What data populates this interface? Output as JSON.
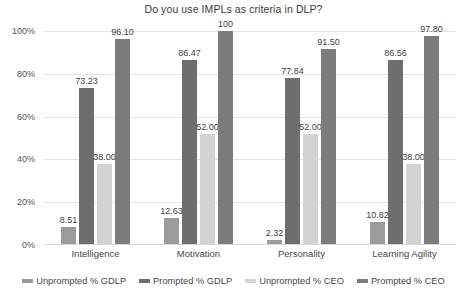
{
  "chart_data": {
    "type": "bar",
    "title": "Do you use IMPLs as criteria in DLP?",
    "xlabel": "",
    "ylabel": "",
    "ylim": [
      0,
      100
    ],
    "ytick_labels": [
      "100%",
      "80%",
      "60%",
      "40%",
      "20%",
      "0%"
    ],
    "ytick_values": [
      100,
      80,
      60,
      40,
      20,
      0
    ],
    "grid": true,
    "legend_position": "bottom",
    "categories": [
      "Intelligence",
      "Motivation",
      "Personality",
      "Learning Agility"
    ],
    "series": [
      {
        "name": "Unprompted % GDLP",
        "color": "#9b9b9b",
        "values": [
          8.51,
          12.63,
          2.32,
          10.82
        ],
        "labels": [
          "8.51",
          "12.63",
          "2.32",
          "10.82"
        ]
      },
      {
        "name": "Prompted % GDLP",
        "color": "#6e6e6e",
        "values": [
          73.23,
          86.47,
          77.84,
          86.56
        ],
        "labels": [
          "73.23",
          "86.47",
          "77.84",
          "86.56"
        ]
      },
      {
        "name": "Unprompted % CEO",
        "color": "#d3d3d3",
        "values": [
          38.0,
          52.0,
          52.0,
          38.0
        ],
        "labels": [
          "38.00",
          "52.00",
          "52.00",
          "38.00"
        ]
      },
      {
        "name": "Prompted % CEO",
        "color": "#7c7c7c",
        "values": [
          96.1,
          100,
          91.5,
          97.8
        ],
        "labels": [
          "96.10",
          "100",
          "91.50",
          "97.80"
        ]
      }
    ]
  }
}
